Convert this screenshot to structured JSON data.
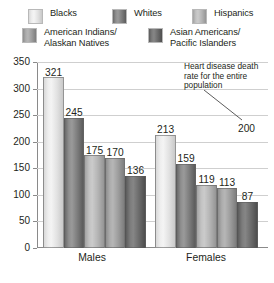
{
  "chart_data": {
    "type": "bar",
    "title": "",
    "xlabel": "",
    "ylabel": "",
    "categories": [
      "Males",
      "Females"
    ],
    "ylim": [
      0,
      350
    ],
    "yticks": [
      0,
      50,
      100,
      150,
      200,
      250,
      300,
      350
    ],
    "ytick_labels": [
      "0",
      "50",
      "100",
      "150",
      "200",
      "250",
      "300",
      "350"
    ],
    "grid": true,
    "legend_position": "top",
    "series": [
      {
        "name": "Blacks",
        "values": [
          321,
          213
        ],
        "color": "#eeeeee"
      },
      {
        "name": "Whites",
        "values": [
          245,
          159
        ],
        "color": "#7d7d7d"
      },
      {
        "name": "Hispanics",
        "values": [
          175,
          119
        ],
        "color": "#c2c2c2"
      },
      {
        "name": "American Indians/\nAlaskan Natives",
        "values": [
          170,
          113
        ],
        "color": "#adadad"
      },
      {
        "name": "Asian Americans/\nPacific Islanders",
        "values": [
          136,
          87
        ],
        "color": "#6b6b6b"
      }
    ],
    "annotations": [
      {
        "text": "Heart disease death\nrate for the entire\npopulation",
        "value": 200,
        "value_label": "200"
      }
    ]
  },
  "legend": {
    "items": [
      {
        "label": "Blacks"
      },
      {
        "label": "Whites"
      },
      {
        "label": "Hispanics"
      },
      {
        "label": "American Indians/\nAlaskan Natives"
      },
      {
        "label": "Asian Americans/\nPacific Islanders"
      }
    ]
  },
  "axis": {
    "y_labels": [
      "350",
      "300",
      "250",
      "200",
      "150",
      "100",
      "50",
      "0"
    ],
    "x_labels": [
      "Males",
      "Females"
    ]
  },
  "values": {
    "males": {
      "blacks": "321",
      "whites": "245",
      "hispanics": "175",
      "amer_indian": "170",
      "asian": "136"
    },
    "females": {
      "blacks": "213",
      "whites": "159",
      "hispanics": "119",
      "amer_indian": "113",
      "asian": "87"
    }
  },
  "annotation": {
    "text": "Heart disease death\nrate for the entire\npopulation",
    "reference_value": "200"
  },
  "colors": {
    "gridline": "#cfcfcf",
    "axis": "#8a8a8a",
    "text": "#231f20"
  }
}
